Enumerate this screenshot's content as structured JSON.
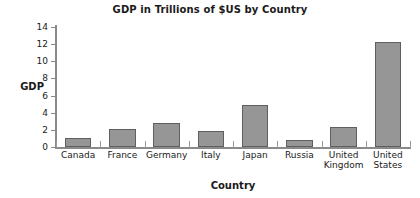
{
  "chart_data": {
    "type": "bar",
    "title": "GDP in Trillions of $US by Country",
    "xlabel": "Country",
    "ylabel": "GDP",
    "categories": [
      "Canada",
      "France",
      "Germany",
      "Italy",
      "Japan",
      "Russia",
      "United Kingdom",
      "United States"
    ],
    "category_labels": [
      "Canada",
      "France",
      "Germany",
      "Italy",
      "Japan",
      "Russia",
      "United\nKingdom",
      "United\nStates"
    ],
    "values": [
      1.0,
      2.1,
      2.8,
      1.85,
      4.9,
      0.8,
      2.3,
      12.2
    ],
    "ylim": [
      0,
      14
    ],
    "yticks": [
      0,
      2,
      4,
      6,
      8,
      10,
      12,
      14
    ],
    "ytick_labels": [
      "0",
      "2",
      "4",
      "6",
      "8",
      "10",
      "12",
      "14"
    ],
    "grid": false,
    "legend": "none",
    "bar_color": "#969696",
    "bar_border_color": "#5f5f5f",
    "axis_color": "#8a8a8a",
    "background_color": "#ffffff",
    "text_color": "#1a1a1a"
  }
}
